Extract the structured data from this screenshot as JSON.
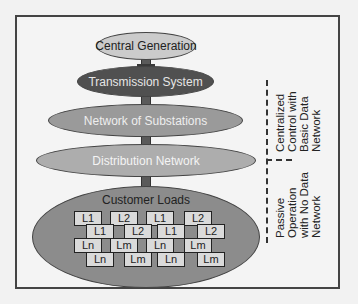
{
  "diagram": {
    "tiers": [
      {
        "label": "Central Generation",
        "fill": "#cbcbcb",
        "text_color": "#222222"
      },
      {
        "label": "Transmission System",
        "fill": "#505050",
        "text_color": "#e6e6e6"
      },
      {
        "label": "Network of Substations",
        "fill": "#9a9a9a",
        "text_color": "#eeeeee"
      },
      {
        "label": "Distribution Network",
        "fill": "#adadad",
        "text_color": "#f4f4f4"
      },
      {
        "label": "Customer Loads",
        "fill": "#8c8c8c",
        "text_color": "#222222"
      }
    ],
    "loads": {
      "row1": [
        "L1",
        "L2",
        "L1",
        "L2"
      ],
      "row2": [
        "L1",
        "L2",
        "L1",
        "L2"
      ],
      "row3": [
        "Ln",
        "Lm",
        "Ln",
        "Lm"
      ],
      "row4": [
        "Ln",
        "Lm",
        "Ln",
        "Lm"
      ]
    },
    "annotations": {
      "upper": [
        "Centralized",
        "Control with",
        "Basic Data",
        "Network"
      ],
      "lower": [
        "Passive",
        "Operation",
        "with No Data",
        "Network"
      ]
    }
  }
}
